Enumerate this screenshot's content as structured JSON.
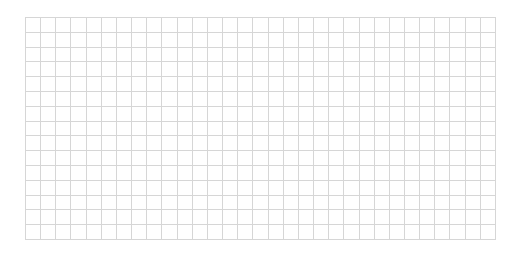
{
  "canvas": {
    "background": "#ffffff"
  },
  "grid": {
    "columns": 31,
    "rows": 15,
    "line_color": "#d6d6d6",
    "cell_width": 15.16,
    "cell_height": 14.8
  }
}
